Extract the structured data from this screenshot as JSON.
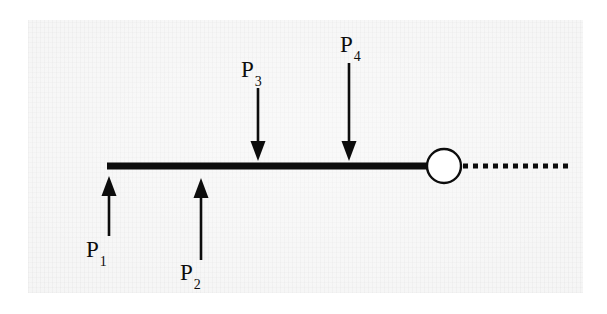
{
  "figure": {
    "kind": "free-body-diagram",
    "canvas": {
      "width": 607,
      "height": 314,
      "background_color": "#ffffff"
    },
    "plate": {
      "x": 28,
      "y": 20,
      "width": 555,
      "height": 273,
      "color": "#f3f3f3"
    },
    "ink_color": "#0d0d0d"
  },
  "beam": {
    "name": "beam",
    "x_start": 107,
    "x_end": 431,
    "y_center": 166,
    "thickness": 7,
    "color": "#0d0d0d"
  },
  "joint": {
    "name": "end-circle",
    "shape": "circle",
    "cx": 444,
    "cy": 166,
    "r": 17,
    "fill": "#ffffff",
    "stroke": "#0d0d0d",
    "stroke_width": 2.4
  },
  "dashed_extension": {
    "name": "dashed-extension-line",
    "x_start": 463,
    "x_end": 571,
    "y": 166,
    "dash": "5 5",
    "thickness": 5,
    "color": "#0d0d0d"
  },
  "forces": [
    {
      "id": "P1",
      "label": "P",
      "subscript": "1",
      "direction": "up",
      "x": 109,
      "tip_y": 176,
      "tail_y": 236,
      "label_x": 86,
      "label_y": 238
    },
    {
      "id": "P2",
      "label": "P",
      "subscript": "2",
      "direction": "up",
      "x": 201,
      "tip_y": 178,
      "tail_y": 260,
      "label_x": 180,
      "label_y": 261
    },
    {
      "id": "P3",
      "label": "P",
      "subscript": "3",
      "direction": "down",
      "x": 258,
      "tip_y": 161,
      "tail_y": 88,
      "label_x": 241,
      "label_y": 58
    },
    {
      "id": "P4",
      "label": "P",
      "subscript": "4",
      "direction": "down",
      "x": 349,
      "tip_y": 161,
      "tail_y": 63,
      "label_x": 340,
      "label_y": 33
    }
  ],
  "arrow_style": {
    "shaft_width": 2.6,
    "head_width": 15,
    "head_length": 20,
    "color": "#0d0d0d"
  }
}
